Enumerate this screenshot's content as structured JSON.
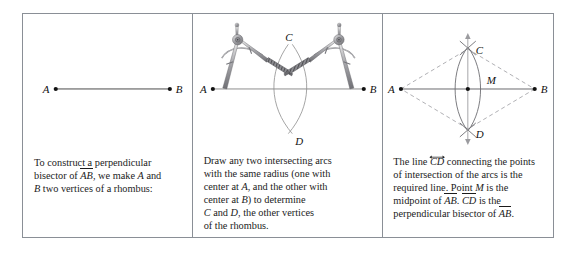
{
  "figure": {
    "kind": "geometry-construction-figure",
    "border_color": "#8a8f96",
    "background": "#ffffff",
    "ink_color": "#111111",
    "panels": [
      {
        "id": "panel-1",
        "diagram": {
          "name": "segment-ab",
          "points": [
            {
              "label": "A",
              "x": 33,
              "y": 75
            },
            {
              "label": "B",
              "x": 148,
              "y": 75
            }
          ],
          "segments": [
            {
              "from": "A",
              "to": "B",
              "style": "solid"
            }
          ]
        },
        "caption_lines": [
          "To construct a perpendicular",
          "bisector of AB, we make A and",
          "B two vertices of a rhombus:"
        ],
        "caption_text": "To construct a perpendicular bisector of AB, we make A and B two vertices of a rhombus:"
      },
      {
        "id": "panel-2",
        "diagram": {
          "name": "two-compasses-drawing-arcs",
          "points": [
            {
              "label": "A",
              "x": 20,
              "y": 75
            },
            {
              "label": "B",
              "x": 172,
              "y": 75
            },
            {
              "label": "C",
              "x": 96,
              "y": 32
            },
            {
              "label": "D",
              "x": 100,
              "y": 119
            }
          ],
          "segments": [
            {
              "from": "A",
              "to": "B",
              "style": "solid"
            }
          ],
          "arcs": [
            {
              "center": "A",
              "radius": 78,
              "note": "arc with center at A"
            },
            {
              "center": "B",
              "radius": 78,
              "note": "arc with center at B"
            }
          ],
          "tools": [
            "compass-left",
            "compass-right"
          ]
        },
        "caption_lines": [
          "Draw any two intersecting arcs",
          "with the same radius (one with",
          "center at A, and the other with",
          "center at B) to determine",
          "C and D, the other vertices",
          "of the rhombus."
        ],
        "caption_text": "Draw any two intersecting arcs with the same radius (one with center at A, and the other with center at B) to determine C and D, the other vertices of the rhombus."
      },
      {
        "id": "panel-3",
        "diagram": {
          "name": "rhombus-with-perpendicular-bisector",
          "points": [
            {
              "label": "A",
              "x": 18,
              "y": 75
            },
            {
              "label": "B",
              "x": 152,
              "y": 75
            },
            {
              "label": "C",
              "x": 85,
              "y": 33
            },
            {
              "label": "D",
              "x": 85,
              "y": 117
            },
            {
              "label": "M",
              "x": 85,
              "y": 75
            }
          ],
          "segments": [
            {
              "from": "A",
              "to": "B",
              "style": "solid"
            }
          ],
          "rhombus_sides": [
            {
              "from": "A",
              "to": "C",
              "style": "dashed"
            },
            {
              "from": "C",
              "to": "B",
              "style": "dashed"
            },
            {
              "from": "B",
              "to": "D",
              "style": "dashed"
            },
            {
              "from": "D",
              "to": "A",
              "style": "dashed"
            }
          ],
          "line_cd": {
            "style": "solid",
            "arrowheads": "both",
            "label": "CD"
          },
          "arcs": [
            {
              "center": "A",
              "radius": 69,
              "note": "arc with center at A"
            },
            {
              "center": "B",
              "radius": 69,
              "note": "arc with center at B"
            }
          ]
        },
        "caption_lines": [
          "The line CD connecting the points",
          "of intersection of the arcs is the",
          "required line. Point M is the",
          "midpoint of AB. CD is the",
          "perpendicular bisector of AB."
        ],
        "caption_text": "The line CD connecting the points of intersection of the arcs is the required line. Point M is the midpoint of AB. CD is the perpendicular bisector of AB."
      }
    ]
  },
  "labels": {
    "A": "A",
    "B": "B",
    "C": "C",
    "D": "D",
    "M": "M",
    "AB": "AB",
    "CD": "CD"
  },
  "caption_fragments": {
    "p1_a": "To construct a perpendicular",
    "p1_b1": "bisector of ",
    "p1_b2": ", we make ",
    "p1_b3": " and",
    "p1_c1": " two vertices of a rhombus:",
    "p2_a": "Draw any two intersecting arcs",
    "p2_b": "with the same radius (one with",
    "p2_c1": "center at ",
    "p2_c2": ", and the other with",
    "p2_d1": "center at ",
    "p2_d2": ") to determine",
    "p2_e1": " and ",
    "p2_e2": ", the other vertices",
    "p2_f": "of the rhombus.",
    "p3_a1": "The line ",
    "p3_a2": " connecting the points",
    "p3_b": "of intersection of the arcs is the",
    "p3_c1": "required line. Point ",
    "p3_c2": " is the",
    "p3_d1": "midpoint of ",
    "p3_d2": ". ",
    "p3_d3": " is the",
    "p3_e1": "perpendicular bisector of ",
    "p3_e2": "."
  }
}
